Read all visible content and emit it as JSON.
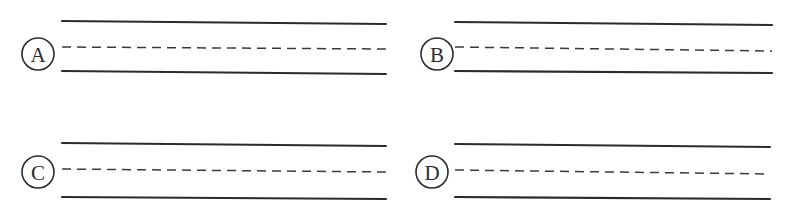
{
  "figure": {
    "width": 798,
    "height": 212,
    "background_color": "#ffffff",
    "line_color": "#2b2b2b",
    "panel_count": 4
  },
  "panels": [
    {
      "id": "a",
      "label": "A",
      "label_circle": {
        "cx": 38,
        "cy": 54,
        "r": 16
      },
      "channel": {
        "x_start": 62,
        "x_end": 386,
        "top_line": {
          "y_start": 21,
          "y_end": 24
        },
        "center_line": {
          "y_start": 47,
          "y_end": 49
        },
        "bottom_line": {
          "y_start": 71,
          "y_end": 74
        },
        "top_style": "solid",
        "center_style": "dashed",
        "bottom_style": "solid",
        "solid_width": 2.1,
        "dashed_width": 1.5,
        "dash_pattern": "9 6"
      }
    },
    {
      "id": "b",
      "label": "B",
      "label_circle": {
        "cx": 38,
        "cy": 54,
        "r": 16
      },
      "channel": {
        "x_start": 56,
        "x_end": 373,
        "top_line": {
          "y_start": 22,
          "y_end": 25
        },
        "center_line": {
          "y_start": 47,
          "y_end": 51
        },
        "bottom_line": {
          "y_start": 71,
          "y_end": 73
        },
        "top_style": "solid",
        "center_style": "dashed",
        "bottom_style": "solid",
        "solid_width": 2.1,
        "dashed_width": 1.5,
        "dash_pattern": "9 6"
      }
    },
    {
      "id": "c",
      "label": "C",
      "label_circle": {
        "cx": 38,
        "cy": 66,
        "r": 16
      },
      "channel": {
        "x_start": 62,
        "x_end": 386,
        "top_line": {
          "y_start": 37,
          "y_end": 40
        },
        "center_line": {
          "y_start": 63,
          "y_end": 66
        },
        "bottom_line": {
          "y_start": 91,
          "y_end": 93
        },
        "top_style": "solid",
        "center_style": "dashed",
        "bottom_style": "solid",
        "solid_width": 2.1,
        "dashed_width": 1.5,
        "dash_pattern": "9 6"
      }
    },
    {
      "id": "d",
      "label": "D",
      "label_circle": {
        "cx": 33,
        "cy": 66,
        "r": 16
      },
      "channel": {
        "x_start": 56,
        "x_end": 371,
        "top_line": {
          "y_start": 38,
          "y_end": 41
        },
        "center_line": {
          "y_start": 64,
          "y_end": 68
        },
        "bottom_line": {
          "y_start": 91,
          "y_end": 93
        },
        "top_style": "solid",
        "center_style": "dashed",
        "bottom_style": "solid",
        "solid_width": 2.1,
        "dashed_width": 1.5,
        "dash_pattern": "9 6"
      }
    }
  ]
}
